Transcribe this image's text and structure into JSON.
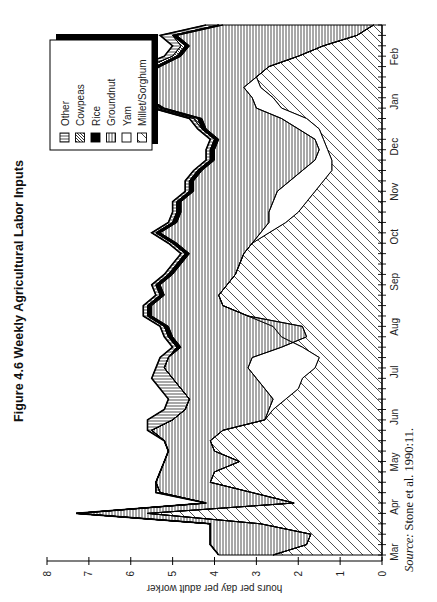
{
  "figure": {
    "title": "Figure 4.6  Weekly Agricultural Labor Inputs",
    "source_prefix": "Source:",
    "source_text": " Stone et al. 1990:11."
  },
  "chart_data": {
    "type": "area",
    "stacked": true,
    "title": "Figure 4.6  Weekly Agricultural Labor Inputs",
    "xlabel": "",
    "ylabel": "hours per day per adult worker",
    "ylim": [
      0,
      8
    ],
    "yticks": [
      0,
      1,
      2,
      3,
      4,
      5,
      6,
      7,
      8
    ],
    "month_labels": [
      "Mar",
      "Apr",
      "May",
      "Jun",
      "Jul",
      "Aug",
      "Sep",
      "Oct",
      "Nov",
      "Dec",
      "Jan",
      "Feb"
    ],
    "x": [
      1,
      2,
      3,
      4,
      5,
      6,
      7,
      8,
      9,
      10,
      11,
      12,
      13,
      14,
      15,
      16,
      17,
      18,
      19,
      20,
      21,
      22,
      23,
      24,
      25,
      26,
      27,
      28,
      29,
      30,
      31,
      32,
      33,
      34,
      35,
      36,
      37,
      38,
      39,
      40,
      41,
      42,
      43,
      44,
      45,
      46,
      47,
      48,
      49,
      50,
      51,
      52
    ],
    "legend_position": "upper-right (inside plot)",
    "series": [
      {
        "name": "Millet/Sorghum",
        "pattern": "diagonal-hatch",
        "cumulative": [
          2.6,
          1.8,
          1.7,
          2.9,
          5.6,
          2.1,
          3.1,
          4.1,
          4.0,
          3.4,
          4.0,
          4.1,
          3.8,
          2.8,
          2.6,
          2.3,
          2.0,
          1.9,
          1.6,
          1.5,
          1.9,
          2.4,
          2.6,
          3.2,
          3.8,
          3.9,
          3.7,
          3.5,
          3.4,
          3.3,
          3.1,
          2.7,
          2.3,
          2.0,
          1.8,
          1.6,
          1.4,
          1.2,
          1.2,
          1.3,
          1.4,
          1.5,
          1.8,
          2.4,
          2.6,
          2.9,
          3.0,
          2.7,
          2.0,
          1.4,
          0.6,
          0.2
        ]
      },
      {
        "name": "Yam",
        "pattern": "blank",
        "cumulative": [
          2.6,
          1.8,
          1.7,
          2.9,
          5.6,
          2.1,
          3.1,
          4.1,
          4.0,
          3.4,
          4.0,
          4.1,
          3.8,
          2.8,
          2.7,
          2.6,
          2.8,
          3.0,
          3.2,
          3.1,
          2.4,
          1.8,
          1.9,
          3.2,
          3.8,
          3.9,
          3.7,
          3.5,
          3.4,
          3.3,
          3.1,
          2.9,
          2.7,
          2.7,
          2.6,
          2.5,
          2.2,
          1.9,
          1.6,
          1.5,
          1.6,
          2.0,
          2.4,
          3.0,
          3.1,
          3.3,
          3.0,
          2.7,
          2.0,
          1.4,
          0.6,
          0.2
        ]
      },
      {
        "name": "Groundnut",
        "pattern": "horizontal-lines",
        "cumulative": [
          3.9,
          4.1,
          4.1,
          4.1,
          7.3,
          4.2,
          5.3,
          5.4,
          5.3,
          5.2,
          5.1,
          5.2,
          5.5,
          5.0,
          4.7,
          4.6,
          4.8,
          5.0,
          5.2,
          5.1,
          4.8,
          5.0,
          5.1,
          5.5,
          5.5,
          5.2,
          5.3,
          5.0,
          4.8,
          4.6,
          4.9,
          5.3,
          4.9,
          4.8,
          4.8,
          4.5,
          4.5,
          4.3,
          4.0,
          4.0,
          3.9,
          4.2,
          4.3,
          5.2,
          5.6,
          5.4,
          5.7,
          5.3,
          4.8,
          4.6,
          4.9,
          3.8
        ]
      },
      {
        "name": "Rice",
        "pattern": "solid-black",
        "cumulative": [
          3.9,
          4.1,
          4.1,
          4.1,
          7.3,
          4.2,
          5.3,
          5.4,
          5.3,
          5.2,
          5.1,
          5.2,
          5.5,
          5.0,
          4.7,
          4.6,
          4.8,
          5.0,
          5.2,
          5.1,
          4.9,
          5.1,
          5.2,
          5.6,
          5.6,
          5.3,
          5.4,
          5.1,
          4.9,
          4.7,
          5.0,
          5.4,
          5.0,
          4.9,
          4.9,
          4.6,
          4.6,
          4.4,
          4.1,
          4.1,
          4.0,
          4.3,
          4.4,
          5.3,
          5.7,
          5.5,
          5.8,
          5.4,
          4.9,
          4.7,
          5.0,
          3.9
        ]
      },
      {
        "name": "Cowpeas",
        "pattern": "dense-diagonal",
        "cumulative": [
          3.9,
          4.1,
          4.1,
          4.1,
          7.3,
          4.2,
          5.3,
          5.4,
          5.3,
          5.2,
          5.1,
          5.2,
          5.5,
          5.0,
          4.7,
          4.6,
          4.8,
          5.0,
          5.2,
          5.1,
          4.9,
          5.1,
          5.2,
          5.6,
          5.6,
          5.3,
          5.4,
          5.1,
          4.9,
          4.7,
          5.0,
          5.4,
          5.0,
          4.9,
          4.9,
          4.6,
          4.6,
          4.4,
          4.1,
          4.1,
          4.0,
          4.3,
          4.5,
          5.4,
          5.9,
          5.8,
          6.1,
          5.6,
          5.0,
          4.8,
          5.0,
          3.9
        ]
      },
      {
        "name": "Other",
        "pattern": "vertical-lines",
        "cumulative": [
          3.9,
          4.1,
          4.1,
          4.1,
          7.3,
          4.2,
          5.4,
          5.4,
          5.3,
          5.2,
          5.1,
          5.2,
          5.6,
          5.6,
          5.2,
          5.1,
          5.3,
          5.5,
          5.4,
          5.3,
          5.0,
          5.2,
          5.3,
          5.7,
          5.7,
          5.4,
          5.5,
          5.2,
          5.0,
          4.8,
          5.1,
          5.5,
          5.1,
          5.0,
          5.0,
          4.7,
          4.7,
          4.5,
          4.2,
          4.2,
          4.1,
          4.4,
          4.6,
          5.5,
          6.1,
          6.2,
          6.3,
          5.8,
          5.2,
          5.0,
          5.3,
          4.2
        ]
      }
    ]
  },
  "axes": {
    "ylabel": "hours per day per adult worker",
    "yticks": [
      "0",
      "1",
      "2",
      "3",
      "4",
      "5",
      "6",
      "7",
      "8"
    ],
    "months": [
      "Mar",
      "Apr",
      "May",
      "Jun",
      "Jul",
      "Aug",
      "Sep",
      "Oct",
      "Nov",
      "Dec",
      "Jan",
      "Feb"
    ]
  },
  "legend": {
    "items": [
      {
        "label": "Other",
        "pattern": "vertical-lines"
      },
      {
        "label": "Cowpeas",
        "pattern": "dense-diagonal"
      },
      {
        "label": "Rice",
        "pattern": "solid-black"
      },
      {
        "label": "Groundnut",
        "pattern": "horizontal-lines"
      },
      {
        "label": "Yam",
        "pattern": "blank"
      },
      {
        "label": "Millet/Sorghum",
        "pattern": "diagonal-hatch"
      }
    ]
  }
}
